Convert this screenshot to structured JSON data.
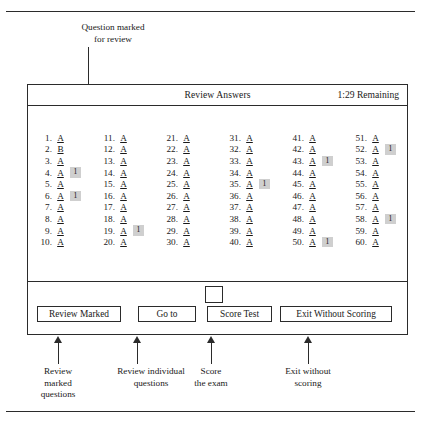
{
  "figure": {
    "top_callout": "Question marked\nfor review",
    "top_callout_line1": "Question marked",
    "top_callout_line2": "for review"
  },
  "window": {
    "title": "Review Answers",
    "timer": "1:29 Remaining"
  },
  "answers": {
    "flag_mark": "1",
    "columns": [
      {
        "name": "column-1",
        "items": [
          {
            "num": "1.",
            "answer": "A",
            "flag": ""
          },
          {
            "num": "2.",
            "answer": "B",
            "flag": ""
          },
          {
            "num": "3.",
            "answer": "A",
            "flag": ""
          },
          {
            "num": "4.",
            "answer": "A",
            "flag": "1"
          },
          {
            "num": "5.",
            "answer": "A",
            "flag": ""
          },
          {
            "num": "6.",
            "answer": "A",
            "flag": "1"
          },
          {
            "num": "7.",
            "answer": "A",
            "flag": ""
          },
          {
            "num": "8.",
            "answer": "A",
            "flag": ""
          },
          {
            "num": "9.",
            "answer": "A",
            "flag": ""
          },
          {
            "num": "10.",
            "answer": "A",
            "flag": ""
          }
        ]
      },
      {
        "name": "column-2",
        "items": [
          {
            "num": "11.",
            "answer": "A",
            "flag": ""
          },
          {
            "num": "12.",
            "answer": "A",
            "flag": ""
          },
          {
            "num": "13.",
            "answer": "A",
            "flag": ""
          },
          {
            "num": "14.",
            "answer": "A",
            "flag": ""
          },
          {
            "num": "15.",
            "answer": "A",
            "flag": ""
          },
          {
            "num": "16.",
            "answer": "A",
            "flag": ""
          },
          {
            "num": "17.",
            "answer": "A",
            "flag": ""
          },
          {
            "num": "18.",
            "answer": "A",
            "flag": ""
          },
          {
            "num": "19.",
            "answer": "A",
            "flag": "1"
          },
          {
            "num": "20.",
            "answer": "A",
            "flag": ""
          }
        ]
      },
      {
        "name": "column-3",
        "items": [
          {
            "num": "21.",
            "answer": "A",
            "flag": ""
          },
          {
            "num": "22.",
            "answer": "A",
            "flag": ""
          },
          {
            "num": "23.",
            "answer": "A",
            "flag": ""
          },
          {
            "num": "24.",
            "answer": "A",
            "flag": ""
          },
          {
            "num": "25.",
            "answer": "A",
            "flag": ""
          },
          {
            "num": "26.",
            "answer": "A",
            "flag": ""
          },
          {
            "num": "27.",
            "answer": "A",
            "flag": ""
          },
          {
            "num": "28.",
            "answer": "A",
            "flag": ""
          },
          {
            "num": "29.",
            "answer": "A",
            "flag": ""
          },
          {
            "num": "30.",
            "answer": "A",
            "flag": ""
          }
        ]
      },
      {
        "name": "column-4",
        "items": [
          {
            "num": "31.",
            "answer": "A",
            "flag": ""
          },
          {
            "num": "32.",
            "answer": "A",
            "flag": ""
          },
          {
            "num": "33.",
            "answer": "A",
            "flag": ""
          },
          {
            "num": "34.",
            "answer": "A",
            "flag": ""
          },
          {
            "num": "35.",
            "answer": "A",
            "flag": "1"
          },
          {
            "num": "36.",
            "answer": "A",
            "flag": ""
          },
          {
            "num": "37.",
            "answer": "A",
            "flag": ""
          },
          {
            "num": "38.",
            "answer": "A",
            "flag": ""
          },
          {
            "num": "39.",
            "answer": "A",
            "flag": ""
          },
          {
            "num": "40.",
            "answer": "A",
            "flag": ""
          }
        ]
      },
      {
        "name": "column-5",
        "items": [
          {
            "num": "41.",
            "answer": "A",
            "flag": ""
          },
          {
            "num": "42.",
            "answer": "A",
            "flag": ""
          },
          {
            "num": "43.",
            "answer": "A",
            "flag": "1"
          },
          {
            "num": "44.",
            "answer": "A",
            "flag": ""
          },
          {
            "num": "45.",
            "answer": "A",
            "flag": ""
          },
          {
            "num": "46.",
            "answer": "A",
            "flag": ""
          },
          {
            "num": "47.",
            "answer": "A",
            "flag": ""
          },
          {
            "num": "48.",
            "answer": "A",
            "flag": ""
          },
          {
            "num": "49.",
            "answer": "A",
            "flag": ""
          },
          {
            "num": "50.",
            "answer": "A",
            "flag": "1"
          }
        ]
      },
      {
        "name": "column-6",
        "items": [
          {
            "num": "51.",
            "answer": "A",
            "flag": ""
          },
          {
            "num": "52.",
            "answer": "A",
            "flag": "1"
          },
          {
            "num": "53.",
            "answer": "A",
            "flag": ""
          },
          {
            "num": "54.",
            "answer": "A",
            "flag": ""
          },
          {
            "num": "55.",
            "answer": "A",
            "flag": ""
          },
          {
            "num": "56.",
            "answer": "A",
            "flag": ""
          },
          {
            "num": "57.",
            "answer": "A",
            "flag": ""
          },
          {
            "num": "58.",
            "answer": "A",
            "flag": "1"
          },
          {
            "num": "59.",
            "answer": "A",
            "flag": ""
          },
          {
            "num": "60.",
            "answer": "A",
            "flag": ""
          }
        ]
      }
    ]
  },
  "buttons": [
    {
      "label": "Review Marked"
    },
    {
      "label": "Go to"
    },
    {
      "label": "Score Test"
    },
    {
      "label": "Exit Without Scoring"
    }
  ],
  "bottom_callouts": [
    {
      "line1": "Review",
      "line2": "marked",
      "line3": "questions"
    },
    {
      "line1": "Review individual",
      "line2": "questions",
      "line3": ""
    },
    {
      "line1": "Score",
      "line2": "the exam",
      "line3": ""
    },
    {
      "line1": "Exit without",
      "line2": "scoring",
      "line3": ""
    }
  ],
  "colors": {
    "ink": "#2b2b2b",
    "flag_bg": "#cfcfcf",
    "page_bg": "#ffffff"
  }
}
